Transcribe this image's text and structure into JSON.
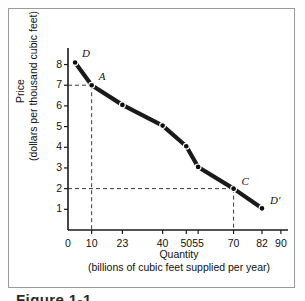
{
  "figure": {
    "caption": "Figure 1-1"
  },
  "chart_data": {
    "type": "line",
    "title": "",
    "xlabel": "Quantity",
    "xlabel_sub": "(billions of cubic feet supplied per year)",
    "ylabel": "Price",
    "ylabel_sub": "(dollars per thousand cubic feet)",
    "xlim": [
      0,
      93
    ],
    "ylim": [
      0,
      8.8
    ],
    "grid": false,
    "legend": false,
    "x_ticks": [
      0,
      10,
      23,
      40,
      50,
      55,
      70,
      82,
      90
    ],
    "x_tick_labels": [
      "0",
      "10",
      "23",
      "40",
      "50",
      "55",
      "70",
      "82",
      "90"
    ],
    "y_ticks": [
      1,
      2,
      3,
      4,
      5,
      6,
      7,
      8
    ],
    "y_tick_labels": [
      "1",
      "2",
      "3",
      "4",
      "5",
      "6",
      "7",
      "8"
    ],
    "series": [
      {
        "name": "Demand curve DD'",
        "color": "#1a1a1a",
        "x": [
          3,
          10,
          23,
          40,
          50,
          55,
          70,
          82
        ],
        "y": [
          8.1,
          7.0,
          6.05,
          5.05,
          4.05,
          3.05,
          2.0,
          1.05
        ]
      }
    ],
    "point_labels": [
      {
        "text": "D",
        "x": 3,
        "y": 8.1
      },
      {
        "text": "A",
        "x": 10,
        "y": 7.0
      },
      {
        "text": "C",
        "x": 70,
        "y": 2.0
      },
      {
        "text": "D′",
        "x": 82,
        "y": 1.05
      }
    ],
    "guide_lines": [
      {
        "label": "A-guide",
        "x": 10,
        "y": 7.0
      },
      {
        "label": "C-guide",
        "x": 70,
        "y": 2.0
      }
    ]
  }
}
